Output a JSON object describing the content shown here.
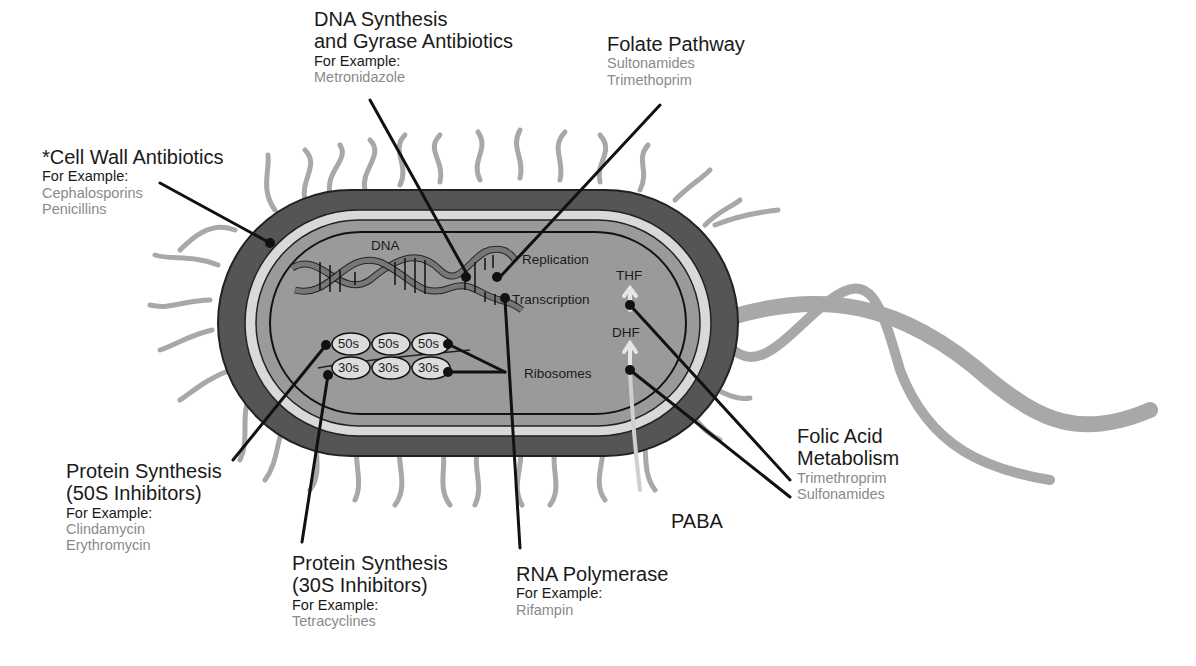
{
  "cell_labels": {
    "dna": "DNA",
    "replication": "Replication",
    "transcription": "Transcription",
    "ribosomes": "Ribosomes",
    "thf": "THF",
    "dhf": "DHF",
    "paba": "PABA",
    "ribosome_50s": [
      "50s",
      "50s",
      "50s"
    ],
    "ribosome_30s": [
      "30s",
      "30s",
      "30s"
    ]
  },
  "callouts": {
    "dna_synthesis": {
      "title_line1": "DNA Synthesis",
      "title_line2": "and Gyrase Antibiotics",
      "example_label": "For Example:",
      "drugs": [
        "Metronidazole"
      ]
    },
    "folate_pathway": {
      "title": "Folate Pathway",
      "drugs": [
        "Sultonamides",
        "Trimethoprim"
      ]
    },
    "cell_wall": {
      "title": "*Cell Wall Antibiotics",
      "example_label": "For Example:",
      "drugs": [
        "Cephalosporins",
        "Penicillins"
      ]
    },
    "protein_50s": {
      "title_line1": "Protein Synthesis",
      "title_line2": "(50S Inhibitors)",
      "example_label": "For Example:",
      "drugs": [
        "Clindamycin",
        "Erythromycin"
      ]
    },
    "protein_30s": {
      "title_line1": "Protein Synthesis",
      "title_line2": "(30S Inhibitors)",
      "example_label": "For Example:",
      "drugs": [
        "Tetracyclines"
      ]
    },
    "rna_polymerase": {
      "title": "RNA Polymerase",
      "example_label": "For Example:",
      "drugs": [
        "Rifampin"
      ]
    },
    "folic_acid": {
      "title_line1": "Folic Acid",
      "title_line2": "Metabolism",
      "drugs": [
        "Trimethroprim",
        "Sulfonamides"
      ]
    }
  },
  "colors": {
    "capsule": "#555555",
    "membrane_light": "#d9d9d9",
    "cytoplasm": "#9a9a9a",
    "pili": "#a8a8a8",
    "drug_text": "#8a8a8a",
    "leader": "#111111"
  }
}
